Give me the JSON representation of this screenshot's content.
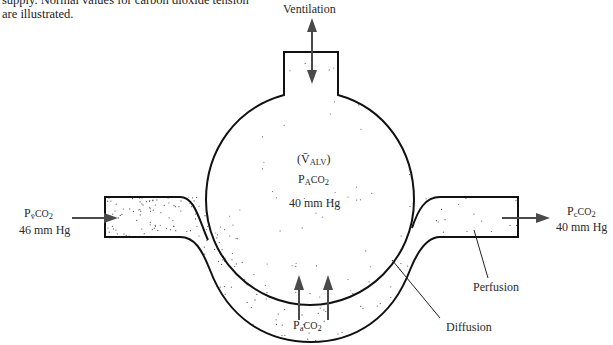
{
  "caption": {
    "line1": "supply. Normal values for carbon dioxide tension",
    "line2": "are illustrated."
  },
  "labels": {
    "ventilation": "Ventilation",
    "valv_open": "(",
    "valv_v": "V̄",
    "valv_sub": "ALV",
    "valv_close": ")",
    "pa_alv_p": "P",
    "pa_alv_sub": "A",
    "pa_alv_gas": "CO",
    "pa_alv_two": "2",
    "pa_alv_value": "40 mm Hg",
    "venous_p": "P",
    "venous_sub": "v̄",
    "venous_gas": "CO",
    "venous_two": "2",
    "venous_value": "46 mm Hg",
    "cap_p": "P",
    "cap_sub": "c",
    "cap_gas": "CO",
    "cap_two": "2",
    "cap_value": "40 mm Hg",
    "arterial_p": "P",
    "arterial_sub": "a",
    "arterial_gas": "CO",
    "arterial_two": "2",
    "perfusion": "Perfusion",
    "diffusion": "Diffusion"
  },
  "colors": {
    "outline": "#111111",
    "arrow": "#4a4a4a",
    "dots": "#555555"
  }
}
